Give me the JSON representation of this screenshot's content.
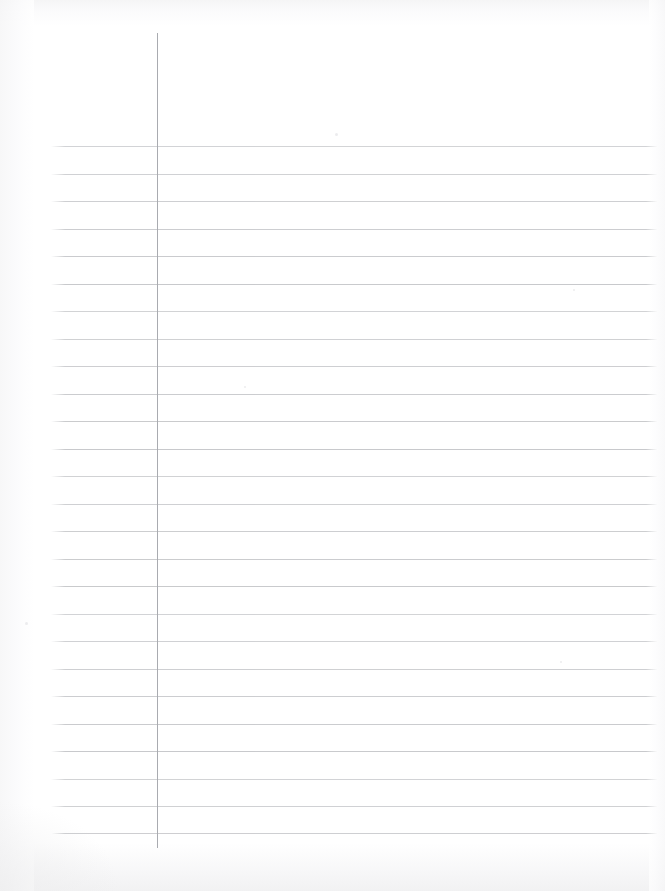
{
  "page": {
    "width": 665,
    "height": 891,
    "background_color": "#ffffff",
    "content_text": "",
    "note": "Scanned blank lined writing paper; no written text present"
  },
  "paper": {
    "rule_color": "#c8c9cc",
    "margin_rule_color": "#a9abb0",
    "rule_count": 26,
    "rule_spacing_px": 27.5,
    "first_rule_y": 146,
    "last_rule_y": 833,
    "rule_start_x": 51,
    "rule_end_x": 658,
    "margin_rule_x": 157,
    "margin_rule_top_y": 33,
    "margin_rule_bottom_y": 848,
    "rules": [
      {
        "y": 146
      },
      {
        "y": 173.5
      },
      {
        "y": 201
      },
      {
        "y": 228.5
      },
      {
        "y": 256
      },
      {
        "y": 283.5
      },
      {
        "y": 311
      },
      {
        "y": 338.5
      },
      {
        "y": 366
      },
      {
        "y": 393.5
      },
      {
        "y": 421
      },
      {
        "y": 448.5
      },
      {
        "y": 476
      },
      {
        "y": 503.5
      },
      {
        "y": 531
      },
      {
        "y": 558.5
      },
      {
        "y": 586
      },
      {
        "y": 613.5
      },
      {
        "y": 641
      },
      {
        "y": 668.5
      },
      {
        "y": 696
      },
      {
        "y": 723.5
      },
      {
        "y": 751
      },
      {
        "y": 778.5
      },
      {
        "y": 806
      },
      {
        "y": 833
      }
    ],
    "specks": [
      {
        "x": 335,
        "y": 133,
        "size": 3
      },
      {
        "x": 25,
        "y": 622,
        "size": 3
      },
      {
        "x": 573,
        "y": 289,
        "size": 2
      },
      {
        "x": 244,
        "y": 386,
        "size": 2
      },
      {
        "x": 560,
        "y": 661,
        "size": 2
      }
    ]
  }
}
